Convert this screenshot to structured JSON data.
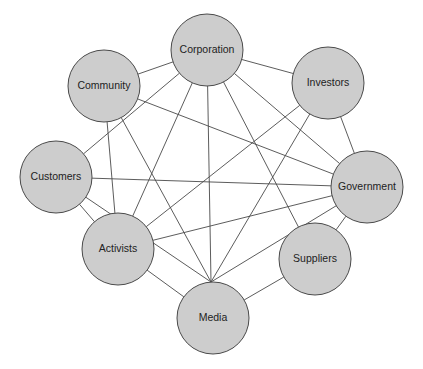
{
  "diagram": {
    "type": "network",
    "colors": {
      "node_fill": "#cdcdcd",
      "node_stroke": "#4a4a4a",
      "edge": "#4a4a4a",
      "text": "#222222"
    },
    "nodes": [
      {
        "id": "corporation",
        "label": "Corporation"
      },
      {
        "id": "community",
        "label": "Community"
      },
      {
        "id": "investors",
        "label": "Investors"
      },
      {
        "id": "customers",
        "label": "Customers"
      },
      {
        "id": "government",
        "label": "Government"
      },
      {
        "id": "activists",
        "label": "Activists"
      },
      {
        "id": "suppliers",
        "label": "Suppliers"
      },
      {
        "id": "media",
        "label": "Media"
      }
    ],
    "edges": [
      [
        "corporation",
        "community"
      ],
      [
        "corporation",
        "investors"
      ],
      [
        "corporation",
        "government"
      ],
      [
        "corporation",
        "customers"
      ],
      [
        "corporation",
        "activists"
      ],
      [
        "corporation",
        "media"
      ],
      [
        "corporation",
        "suppliers"
      ],
      [
        "community",
        "government"
      ],
      [
        "community",
        "activists"
      ],
      [
        "community",
        "media"
      ],
      [
        "investors",
        "government"
      ],
      [
        "investors",
        "activists"
      ],
      [
        "investors",
        "media"
      ],
      [
        "customers",
        "government"
      ],
      [
        "customers",
        "activists"
      ],
      [
        "customers",
        "media"
      ],
      [
        "government",
        "activists"
      ],
      [
        "government",
        "media"
      ],
      [
        "government",
        "suppliers"
      ],
      [
        "activists",
        "media"
      ],
      [
        "suppliers",
        "media"
      ]
    ]
  }
}
